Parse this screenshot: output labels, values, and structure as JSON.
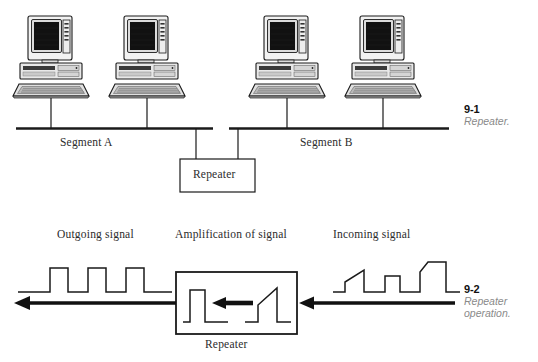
{
  "figure": {
    "page_background": "#ffffff",
    "ink_color": "#1a1a1a"
  },
  "top_diagram": {
    "segment_a_label": "Segment A",
    "segment_b_label": "Segment B",
    "repeater_box_label": "Repeater",
    "workstation_count": 4,
    "workstations": [
      {
        "name": "workstation-a1",
        "segment": "Segment A",
        "x": 52
      },
      {
        "name": "workstation-a2",
        "segment": "Segment A",
        "x": 148
      },
      {
        "name": "workstation-b1",
        "segment": "Segment B",
        "x": 288
      },
      {
        "name": "workstation-b2",
        "segment": "Segment B",
        "x": 384
      }
    ]
  },
  "bottom_diagram": {
    "outgoing_label": "Outgoing signal",
    "amplification_label": "Amplification of signal",
    "incoming_label": "Incoming signal",
    "repeater_label": "Repeater",
    "signal_direction": "right-to-left",
    "outgoing_pulse_count": 3,
    "incoming_pulse_count": 3,
    "outgoing_pulse_quality": "clean-square-uniform",
    "incoming_pulse_quality": "degraded-sloped-uneven"
  },
  "captions": {
    "fig1_number": "9-1",
    "fig1_text": "Repeater.",
    "fig2_number": "9-2",
    "fig2_text_line1": "Repeater",
    "fig2_text_line2": "operation."
  }
}
